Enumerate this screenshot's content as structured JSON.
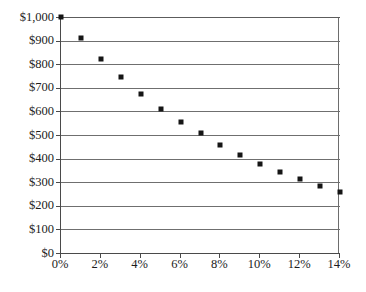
{
  "chart_data": {
    "type": "scatter",
    "title": "",
    "subtitle": "",
    "xlabel": "",
    "ylabel": "",
    "xlim": [
      0,
      14
    ],
    "ylim": [
      0,
      1000
    ],
    "grid": true,
    "legend": false,
    "legend_position": "none",
    "marker": "square",
    "marker_color": "#151515",
    "grid_color": "#6f6f6f",
    "axis_color": "#4a4a4a",
    "x_tick_labels": [
      "0%",
      "2%",
      "4%",
      "6%",
      "8%",
      "10%",
      "12%",
      "14%"
    ],
    "x_tick_values": [
      0,
      2,
      4,
      6,
      8,
      10,
      12,
      14
    ],
    "y_tick_labels": [
      "$0",
      "$100",
      "$200",
      "$300",
      "$400",
      "$500",
      "$600",
      "$700",
      "$800",
      "$900",
      "$1,000"
    ],
    "y_tick_values": [
      0,
      100,
      200,
      300,
      400,
      500,
      600,
      700,
      800,
      900,
      1000
    ],
    "x": [
      0,
      1,
      2,
      3,
      4,
      5,
      6,
      7,
      8,
      9,
      10,
      11,
      12,
      13,
      14
    ],
    "values": [
      1000,
      910,
      820,
      745,
      675,
      612,
      555,
      508,
      458,
      417,
      377,
      344,
      315,
      285,
      258
    ],
    "series": [
      {
        "name": "Present value",
        "x": [
          0,
          1,
          2,
          3,
          4,
          5,
          6,
          7,
          8,
          9,
          10,
          11,
          12,
          13,
          14
        ],
        "values": [
          1000,
          910,
          820,
          745,
          675,
          612,
          555,
          508,
          458,
          417,
          377,
          344,
          315,
          285,
          258
        ]
      }
    ],
    "annotations": []
  }
}
